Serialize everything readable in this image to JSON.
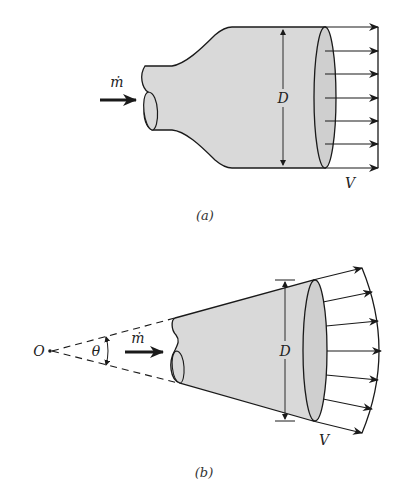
{
  "figure_a": {
    "caption": "(a)",
    "labels": {
      "mass_flow": "ṁ",
      "diameter": "D",
      "velocity": "V"
    },
    "description": "Nozzle expanding to uniform exit velocity profile",
    "velocity_arrows": 7
  },
  "figure_b": {
    "caption": "(b)",
    "labels": {
      "origin": "O",
      "angle": "θ",
      "mass_flow": "ṁ",
      "diameter": "D",
      "velocity": "V"
    },
    "description": "Conical diffuser with radial exit velocity profile from apex O",
    "velocity_arrows": 7
  },
  "colors": {
    "fill": "#d9d9d9",
    "stroke": "#1a1a1a",
    "background": "#ffffff"
  }
}
